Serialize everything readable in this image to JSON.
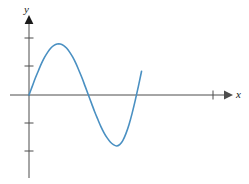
{
  "figure": {
    "background_color": "#ffffff",
    "width": 249,
    "height": 184
  },
  "axes": {
    "x_axis": {
      "label": "x",
      "line_color": "#4d4d4d",
      "origin_px": 29,
      "y_px": 95,
      "start_px": 10,
      "end_px": 232,
      "arrow": "right",
      "ticks_px": [
        213
      ]
    },
    "y_axis": {
      "label": "y",
      "line_color": "#4d4d4d",
      "x_px": 29,
      "top_px": 18,
      "bottom_px": 178,
      "arrow": "up",
      "ticks_px": [
        38,
        66,
        123,
        151
      ]
    }
  },
  "chart_data": {
    "type": "line",
    "title": "",
    "xlabel": "x",
    "ylabel": "y",
    "grid": false,
    "legend": null,
    "curve_color": "#4a90c2",
    "curve_width": 1.6,
    "xlim": [
      0,
      4.35
    ],
    "ylim": [
      -2.1,
      2.75
    ],
    "x": [
      0.0,
      0.1,
      0.2,
      0.3,
      0.4,
      0.5,
      0.6,
      0.7,
      0.8,
      0.9,
      1.0,
      1.1,
      1.2,
      1.3,
      1.4,
      1.5,
      1.6,
      1.7,
      1.8,
      1.9,
      2.0,
      2.1,
      2.2,
      2.3,
      2.4,
      2.5,
      2.6,
      2.7,
      2.8,
      2.9,
      3.0,
      3.1,
      3.2,
      3.3,
      3.4,
      3.5,
      3.6
    ],
    "y": [
      0.0,
      0.31,
      0.62,
      0.9,
      1.17,
      1.4,
      1.59,
      1.74,
      1.84,
      1.89,
      1.89,
      1.84,
      1.74,
      1.59,
      1.4,
      1.17,
      0.9,
      0.62,
      0.31,
      0.0,
      -0.31,
      -0.62,
      -0.9,
      -1.17,
      -1.4,
      -1.59,
      -1.74,
      -1.84,
      -1.89,
      -1.84,
      -1.69,
      -1.43,
      -1.09,
      -0.67,
      -0.19,
      0.33,
      0.88
    ],
    "key_points": [
      {
        "name": "origin-start",
        "x": 0.0,
        "y": 0.0,
        "px": [
          29,
          95
        ]
      },
      {
        "name": "maximum",
        "x": 0.95,
        "y": 1.89,
        "px": [
          58,
          44
        ]
      },
      {
        "name": "zero-crossing-1",
        "x": 1.9,
        "y": 0.0,
        "px": [
          89,
          95
        ]
      },
      {
        "name": "minimum",
        "x": 2.85,
        "y": -1.89,
        "px": [
          120,
          147
        ]
      },
      {
        "name": "zero-crossing-2",
        "x": 3.9,
        "y": 0.0,
        "px": [
          151,
          95
        ]
      },
      {
        "name": "curve-end",
        "x": 4.35,
        "y": 1.25,
        "px": [
          165,
          61
        ]
      }
    ]
  }
}
